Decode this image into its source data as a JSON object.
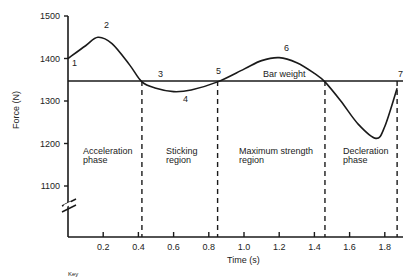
{
  "chart_data": {
    "type": "line",
    "title": "",
    "xlabel": "Time (s)",
    "ylabel": "Force (N)",
    "xlim": [
      0,
      1.9
    ],
    "ylim": [
      1000,
      1500
    ],
    "y_axis_break": true,
    "x_ticks": [
      "0.2",
      "0.4",
      "0.6",
      "0.8",
      "1.0",
      "1.2",
      "1.4",
      "1.6",
      "1.8"
    ],
    "x_tick_values": [
      0.2,
      0.4,
      0.6,
      0.8,
      1.0,
      1.2,
      1.4,
      1.6,
      1.8
    ],
    "y_ticks": [
      "1100",
      "1200",
      "1300",
      "1400",
      "1500"
    ],
    "y_tick_values": [
      1100,
      1200,
      1300,
      1400,
      1500
    ],
    "grid": false,
    "series": [
      {
        "name": "Force",
        "x": [
          0.0,
          0.1,
          0.17,
          0.25,
          0.35,
          0.42,
          0.5,
          0.6,
          0.7,
          0.85,
          1.0,
          1.1,
          1.2,
          1.3,
          1.4,
          1.46,
          1.55,
          1.65,
          1.75,
          1.8,
          1.87
        ],
        "values": [
          1400,
          1430,
          1450,
          1435,
          1385,
          1345,
          1330,
          1322,
          1326,
          1345,
          1375,
          1395,
          1402,
          1390,
          1365,
          1345,
          1300,
          1245,
          1212,
          1240,
          1330
        ]
      }
    ],
    "reference_lines": [
      {
        "label": "Bar weight",
        "y": 1345
      }
    ],
    "phase_boundaries": [
      0.42,
      0.85,
      1.46,
      1.87
    ],
    "point_labels": [
      {
        "label": "1",
        "x": 0.0,
        "y": 1400
      },
      {
        "label": "2",
        "x": 0.17,
        "y": 1450
      },
      {
        "label": "3",
        "x": 0.42,
        "y": 1345
      },
      {
        "label": "4",
        "x": 0.6,
        "y": 1322
      },
      {
        "label": "5",
        "x": 0.85,
        "y": 1345
      },
      {
        "label": "6",
        "x": 1.2,
        "y": 1402
      },
      {
        "label": "7",
        "x": 1.87,
        "y": 1345
      }
    ],
    "regions": [
      {
        "label_line1": "Acceleration",
        "label_line2": "phase"
      },
      {
        "label_line1": "Sticking",
        "label_line2": "region"
      },
      {
        "label_line1": "Maximum strength",
        "label_line2": "region"
      },
      {
        "label_line1": "Decleration",
        "label_line2": "phase"
      }
    ]
  },
  "footer": {
    "key_label": "Key"
  },
  "colors": {
    "line": "#1a1a1a",
    "background": "#ffffff"
  }
}
